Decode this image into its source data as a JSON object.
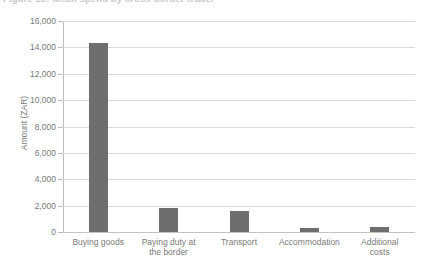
{
  "figure": {
    "title": "Figure 10: Mean spend by cross-border trader",
    "title_number": "Figure 10:",
    "title_text": "Mean spend by cross-border trader"
  },
  "chart_data": {
    "type": "bar",
    "title": "Figure 10: Mean spend by cross-border trader",
    "xlabel": "",
    "ylabel": "Amount (ZAR)",
    "ylim": [
      0,
      16000
    ],
    "ytick_step": 2000,
    "ytick_labels": [
      "16,000",
      "14,000",
      "12,000",
      "10,000",
      "8,000",
      "6,000",
      "4,000",
      "2,000",
      "0"
    ],
    "ytick_values": [
      16000,
      14000,
      12000,
      10000,
      8000,
      6000,
      4000,
      2000,
      0
    ],
    "categories": [
      "Buying goods",
      "Paying duty at\nthe border",
      "Transport",
      "Accommodation",
      "Additional\ncosts"
    ],
    "category_labels": [
      {
        "line1": "Buying goods",
        "line2": ""
      },
      {
        "line1": "Paying duty at",
        "line2": "the border"
      },
      {
        "line1": "Transport",
        "line2": ""
      },
      {
        "line1": "Accommodation",
        "line2": ""
      },
      {
        "line1": "Additional",
        "line2": "costs"
      }
    ],
    "values": [
      14300,
      1800,
      1600,
      300,
      400
    ],
    "grid": true,
    "grid_axis": "y",
    "legend": null,
    "bar_color": "#6e6e6e",
    "grid_color": "#d9d9d9",
    "axis_color": "#bdbdbd",
    "text_color": "#7a7a7a"
  }
}
